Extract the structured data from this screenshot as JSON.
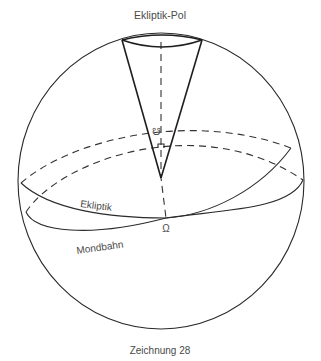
{
  "labels": {
    "pole": "Ekliptik-Pol",
    "ecliptic": "Ekliptik",
    "moon_orbit": "Mondbahn",
    "ascending_node_symbol": "Ω",
    "descending_node_symbol": "☋",
    "caption": "Zeichnung 28"
  },
  "colors": {
    "line": "#2a2a2a",
    "text": "#4a4a4a",
    "background": "#ffffff"
  }
}
